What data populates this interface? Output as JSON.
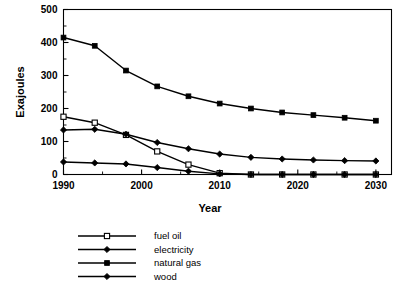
{
  "chart_data": {
    "type": "line",
    "title": "",
    "xlabel": "Year",
    "ylabel": "Exajoules",
    "xlim": [
      1990,
      2032
    ],
    "ylim": [
      0,
      500
    ],
    "xticks": [
      1990,
      2000,
      2010,
      2020,
      2030
    ],
    "xtick_labels": [
      "1990",
      "2000",
      "2010",
      "2020",
      "2030"
    ],
    "xminor_step": 5,
    "yticks": [
      0,
      100,
      200,
      300,
      400,
      500
    ],
    "ytick_labels": [
      "0",
      "100",
      "200",
      "300",
      "400",
      "500"
    ],
    "yminor_step": 50,
    "grid": false,
    "legend_position": "below-left",
    "x": [
      1990,
      1994,
      1998,
      2002,
      2006,
      2010,
      2014,
      2018,
      2022,
      2026,
      2030
    ],
    "series": [
      {
        "name": "fuel oil",
        "marker": "open-square",
        "values": [
          175,
          157,
          120,
          70,
          30,
          4,
          0,
          0,
          0,
          0,
          0
        ]
      },
      {
        "name": "electricity",
        "marker": "filled-diamond",
        "values": [
          135,
          137,
          122,
          97,
          78,
          62,
          52,
          47,
          44,
          42,
          41
        ]
      },
      {
        "name": "natural gas",
        "marker": "filled-square",
        "values": [
          415,
          390,
          315,
          267,
          237,
          215,
          200,
          188,
          180,
          172,
          163
        ]
      },
      {
        "name": "wood",
        "marker": "filled-diamond",
        "values": [
          38,
          35,
          32,
          21,
          10,
          2,
          0,
          0,
          0,
          0,
          0
        ]
      }
    ]
  },
  "legend": {
    "entries": [
      {
        "label": "fuel oil",
        "marker": "open-square"
      },
      {
        "label": "electricity",
        "marker": "filled-diamond"
      },
      {
        "label": "natural gas",
        "marker": "filled-square"
      },
      {
        "label": "wood",
        "marker": "filled-diamond"
      }
    ]
  },
  "colors": {
    "line": "#000000",
    "background": "#ffffff",
    "axis": "#000000"
  }
}
